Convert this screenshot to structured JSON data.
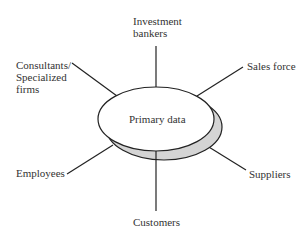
{
  "diagram": {
    "center": {
      "label": "Primary data"
    },
    "sources": [
      {
        "id": "investment-bankers",
        "label": "Investment\nbankers"
      },
      {
        "id": "consultants",
        "label": "Consultants/\nSpecialized\nfirms"
      },
      {
        "id": "sales-force",
        "label": "Sales force"
      },
      {
        "id": "employees",
        "label": "Employees"
      },
      {
        "id": "suppliers",
        "label": "Suppliers"
      },
      {
        "id": "customers",
        "label": "Customers"
      }
    ],
    "colors": {
      "line": "#222222",
      "ellipse_fill": "#ffffff",
      "shadow_fill": "#d4d4d4",
      "text": "#333333"
    }
  }
}
